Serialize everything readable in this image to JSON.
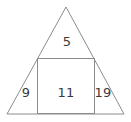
{
  "figure": {
    "type": "geometry-diagram",
    "background_color": "#ffffff",
    "line_color": "#8c8c8c",
    "text_color": "#3a3a3a",
    "shapes": {
      "triangle": {
        "name": "triangle",
        "apex": {
          "x": 66,
          "y": 7
        },
        "base_left": {
          "x": 7,
          "y": 114
        },
        "base_right": {
          "x": 124,
          "y": 114
        }
      },
      "square": {
        "name": "inscribed-square",
        "left": 37,
        "right": 95,
        "top": 58,
        "bottom": 114
      }
    },
    "regions": [
      {
        "id": "top",
        "name": "top-triangle-region",
        "label": "5",
        "label_x": 67,
        "label_y": 42
      },
      {
        "id": "left",
        "name": "left-triangle-region",
        "label": "9",
        "label_x": 26,
        "label_y": 93
      },
      {
        "id": "center",
        "name": "center-square-region",
        "label": "11",
        "label_x": 66,
        "label_y": 93
      },
      {
        "id": "right",
        "name": "right-triangle-region",
        "label": "19",
        "label_x": 103,
        "label_y": 93
      }
    ]
  }
}
